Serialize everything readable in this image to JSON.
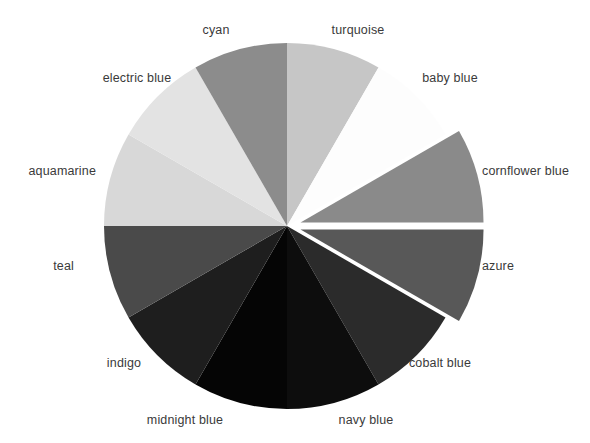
{
  "chart_data": {
    "type": "pie",
    "title": "",
    "subtitle": "",
    "xlabel": "",
    "ylabel": "",
    "legend_position": "outside-labels",
    "grid": false,
    "background_color": "#ffffff",
    "label_color": "#3a3a3a",
    "center": {
      "x": 287,
      "y": 226
    },
    "radius": 183,
    "start_angle_deg": -90,
    "direction": "clockwise",
    "categories": [
      "turquoise",
      "baby blue",
      "cornflower blue",
      "azure",
      "cobalt blue",
      "navy blue",
      "midnight blue",
      "indigo",
      "teal",
      "aquamarine",
      "electric blue",
      "cyan"
    ],
    "values": [
      30,
      30,
      30,
      30,
      30,
      30,
      30,
      30,
      30,
      30,
      30,
      30
    ],
    "percentages": [
      8.33,
      8.33,
      8.33,
      8.33,
      8.33,
      8.33,
      8.33,
      8.33,
      8.33,
      8.33,
      8.33,
      8.33
    ],
    "colors": [
      "#c6c6c6",
      "#fdfdfd",
      "#8a8a8a",
      "#585858",
      "#2b2b2b",
      "#0d0d0d",
      "#050505",
      "#1e1e1e",
      "#4a4a4a",
      "#d8d8d8",
      "#e3e3e3",
      "#8c8c8c"
    ],
    "exploded": [
      false,
      false,
      true,
      true,
      false,
      false,
      false,
      false,
      false,
      false,
      false,
      false
    ],
    "explode_offset_px": 14,
    "slices": [
      {
        "label": "turquoise",
        "color": "#c6c6c6",
        "start_deg": -90,
        "end_deg": -60,
        "exploded": false,
        "label_x": 358,
        "label_y": 30,
        "label_anchor": "mid"
      },
      {
        "label": "baby blue",
        "color": "#fdfdfd",
        "start_deg": -60,
        "end_deg": -30,
        "exploded": false,
        "label_x": 450,
        "label_y": 78,
        "label_anchor": "mid"
      },
      {
        "label": "cornflower blue",
        "color": "#8a8a8a",
        "start_deg": -30,
        "end_deg": 0,
        "exploded": true,
        "label_x": 482,
        "label_y": 171,
        "label_anchor": "start"
      },
      {
        "label": "azure",
        "color": "#585858",
        "start_deg": 0,
        "end_deg": 30,
        "exploded": true,
        "label_x": 482,
        "label_y": 266,
        "label_anchor": "start"
      },
      {
        "label": "cobalt blue",
        "color": "#2b2b2b",
        "start_deg": 30,
        "end_deg": 60,
        "exploded": false,
        "label_x": 440,
        "label_y": 363,
        "label_anchor": "mid"
      },
      {
        "label": "navy blue",
        "color": "#0d0d0d",
        "start_deg": 60,
        "end_deg": 90,
        "exploded": false,
        "label_x": 366,
        "label_y": 420,
        "label_anchor": "mid"
      },
      {
        "label": "midnight blue",
        "color": "#050505",
        "start_deg": 90,
        "end_deg": 120,
        "exploded": false,
        "label_x": 185,
        "label_y": 420,
        "label_anchor": "mid"
      },
      {
        "label": "indigo",
        "color": "#1e1e1e",
        "start_deg": 120,
        "end_deg": 150,
        "exploded": false,
        "label_x": 124,
        "label_y": 363,
        "label_anchor": "mid"
      },
      {
        "label": "teal",
        "color": "#4a4a4a",
        "start_deg": 150,
        "end_deg": 180,
        "exploded": false,
        "label_x": 74,
        "label_y": 266,
        "label_anchor": "end"
      },
      {
        "label": "aquamarine",
        "color": "#d8d8d8",
        "start_deg": 180,
        "end_deg": 210,
        "exploded": false,
        "label_x": 96,
        "label_y": 171,
        "label_anchor": "end"
      },
      {
        "label": "electric blue",
        "color": "#e3e3e3",
        "start_deg": 210,
        "end_deg": 240,
        "exploded": false,
        "label_x": 137,
        "label_y": 78,
        "label_anchor": "mid"
      },
      {
        "label": "cyan",
        "color": "#8c8c8c",
        "start_deg": 240,
        "end_deg": 270,
        "exploded": false,
        "label_x": 216,
        "label_y": 30,
        "label_anchor": "mid"
      }
    ]
  }
}
